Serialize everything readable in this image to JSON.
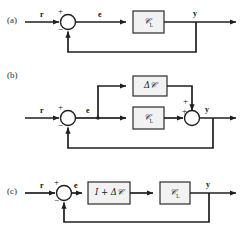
{
  "figure": {
    "type": "block-diagram",
    "panels": [
      {
        "id": "a",
        "label": "(a)",
        "input_label": "r",
        "error_label": "e",
        "output_label": "y",
        "summing_signs": {
          "top": "+",
          "bottom": "−"
        },
        "blocks": [
          {
            "id": "a-gl",
            "text": "𝒞",
            "subscript": "L",
            "plain": "G_L"
          }
        ],
        "feedback": "unity-negative"
      },
      {
        "id": "b",
        "label": "(b)",
        "input_label": "r",
        "error_label": "e",
        "output_label": "y",
        "summing_signs": {
          "top": "+",
          "bottom": "−"
        },
        "sum2_signs": {
          "top": "+",
          "left": "+"
        },
        "blocks": [
          {
            "id": "b-dg",
            "text": "Δ𝒞",
            "subscript": "",
            "plain": "Delta G"
          },
          {
            "id": "b-gl",
            "text": "𝒞",
            "subscript": "L",
            "plain": "G_L"
          }
        ],
        "feedback": "unity-negative"
      },
      {
        "id": "c",
        "label": "(c)",
        "input_label": "r",
        "error_label": "e",
        "output_label": "y",
        "summing_signs": {
          "top": "+",
          "bottom": "−"
        },
        "blocks": [
          {
            "id": "c-idg",
            "text": "𝐼 + Δ𝒞",
            "subscript": "",
            "plain": "I + Delta G"
          },
          {
            "id": "c-gl",
            "text": "𝒞",
            "subscript": "L",
            "plain": "G_L"
          }
        ],
        "feedback": "unity-negative"
      }
    ],
    "colors": {
      "line": "#1f1f1f",
      "block_fill": "#f2f2f2",
      "block_stroke": "#2a2a2a",
      "background": "#ffffff",
      "text": "#1a1a1a"
    }
  }
}
